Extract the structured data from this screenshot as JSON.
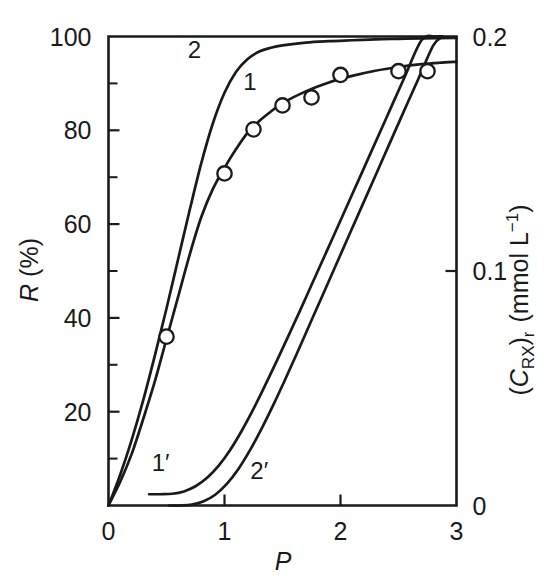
{
  "chart_data": {
    "type": "line",
    "title": "",
    "subtitle": "",
    "xlabel": "P",
    "xlabel_style": "italic",
    "ylabel": "R (%)",
    "ylabel_left_parts": {
      "symbol": "R",
      "units": "(%)"
    },
    "ylabel_right": "(C_RX)_r (mmol L^-1)",
    "ylabel_right_parts": {
      "open_paren": "(",
      "symbol": "C",
      "symbol_sub": "RX",
      "close_paren": ")",
      "close_sub": "r",
      "units_open": "(mmol L",
      "units_sup": "−1",
      "units_close": ")"
    },
    "xlim": [
      0,
      3
    ],
    "ylim_left": [
      0,
      100
    ],
    "ylim_right": [
      0,
      0.2
    ],
    "grid": false,
    "legend": "inline-curve-labels",
    "x_ticks_major": [
      0,
      1,
      2,
      3
    ],
    "x_ticklabels": [
      "0",
      "1",
      "2",
      "3"
    ],
    "y_left_ticks_major": [
      0,
      20,
      40,
      60,
      80,
      100
    ],
    "y_left_ticklabels": [
      "0",
      "20",
      "40",
      "60",
      "80",
      "100"
    ],
    "y_left_ticklabels_shown": [
      "20",
      "40",
      "60",
      "80",
      "100"
    ],
    "y_left_ticks_minor": [
      10,
      30,
      50,
      70,
      90
    ],
    "y_right_ticks_major": [
      0,
      0.1,
      0.2
    ],
    "y_right_ticklabels": [
      "0",
      "0.1",
      "0.2"
    ],
    "series": [
      {
        "name": "1",
        "label": "1",
        "axis": "left",
        "label_x": 1.22,
        "label_y": 88.5,
        "points": [
          [
            0.0,
            0.0
          ],
          [
            0.1,
            5.0
          ],
          [
            0.2,
            11.0
          ],
          [
            0.3,
            18.5
          ],
          [
            0.4,
            26.5
          ],
          [
            0.5,
            35.5
          ],
          [
            0.6,
            44.5
          ],
          [
            0.7,
            53.5
          ],
          [
            0.8,
            61.5
          ],
          [
            0.9,
            67.5
          ],
          [
            1.0,
            72.0
          ],
          [
            1.1,
            76.0
          ],
          [
            1.2,
            79.5
          ],
          [
            1.3,
            82.0
          ],
          [
            1.4,
            84.0
          ],
          [
            1.5,
            85.8
          ],
          [
            1.7,
            88.3
          ],
          [
            1.9,
            90.2
          ],
          [
            2.1,
            91.6
          ],
          [
            2.3,
            92.7
          ],
          [
            2.5,
            93.5
          ],
          [
            2.7,
            94.1
          ],
          [
            2.85,
            94.4
          ],
          [
            3.0,
            94.6
          ]
        ]
      },
      {
        "name": "2",
        "label": "2",
        "axis": "left",
        "label_x": 0.74,
        "label_y": 95.5,
        "points": [
          [
            0.0,
            0.0
          ],
          [
            0.1,
            6.5
          ],
          [
            0.2,
            14.0
          ],
          [
            0.3,
            22.5
          ],
          [
            0.4,
            32.0
          ],
          [
            0.5,
            42.0
          ],
          [
            0.6,
            52.5
          ],
          [
            0.7,
            63.0
          ],
          [
            0.8,
            73.0
          ],
          [
            0.9,
            81.5
          ],
          [
            1.0,
            88.0
          ],
          [
            1.1,
            92.5
          ],
          [
            1.2,
            95.2
          ],
          [
            1.3,
            96.8
          ],
          [
            1.4,
            97.6
          ],
          [
            1.5,
            98.1
          ],
          [
            1.7,
            98.7
          ],
          [
            1.9,
            99.0
          ],
          [
            2.1,
            99.2
          ],
          [
            2.3,
            99.4
          ],
          [
            2.5,
            99.5
          ],
          [
            2.7,
            99.6
          ],
          [
            3.0,
            99.7
          ]
        ]
      },
      {
        "name": "1'",
        "label": "1′",
        "axis": "right",
        "label_x": 0.45,
        "label_y_right": 0.0148,
        "points": [
          [
            0.35,
            0.0048
          ],
          [
            0.45,
            0.0048
          ],
          [
            0.55,
            0.005
          ],
          [
            0.65,
            0.006
          ],
          [
            0.75,
            0.0082
          ],
          [
            0.85,
            0.0118
          ],
          [
            0.95,
            0.017
          ],
          [
            1.05,
            0.0238
          ],
          [
            1.15,
            0.032
          ],
          [
            1.25,
            0.0412
          ],
          [
            1.35,
            0.0512
          ],
          [
            1.45,
            0.0616
          ],
          [
            1.55,
            0.0722
          ],
          [
            1.65,
            0.083
          ],
          [
            1.75,
            0.094
          ],
          [
            1.85,
            0.105
          ],
          [
            1.95,
            0.116
          ],
          [
            2.1,
            0.1326
          ],
          [
            2.25,
            0.1492
          ],
          [
            2.4,
            0.1658
          ],
          [
            2.55,
            0.1824
          ],
          [
            2.7,
            0.1985
          ],
          [
            2.82,
            0.206
          ],
          [
            2.88,
            0.208
          ]
        ]
      },
      {
        "name": "2'",
        "label": "2′",
        "axis": "right",
        "label_x": 1.3,
        "label_y_right": 0.0115,
        "points": [
          [
            0.52,
            0.0
          ],
          [
            0.62,
            0.0
          ],
          [
            0.72,
            0.0004
          ],
          [
            0.82,
            0.0018
          ],
          [
            0.92,
            0.0046
          ],
          [
            1.02,
            0.0092
          ],
          [
            1.12,
            0.0156
          ],
          [
            1.22,
            0.0236
          ],
          [
            1.32,
            0.0328
          ],
          [
            1.42,
            0.0428
          ],
          [
            1.52,
            0.0534
          ],
          [
            1.62,
            0.0644
          ],
          [
            1.72,
            0.0756
          ],
          [
            1.82,
            0.0868
          ],
          [
            1.92,
            0.098
          ],
          [
            2.07,
            0.1148
          ],
          [
            2.22,
            0.1316
          ],
          [
            2.37,
            0.1484
          ],
          [
            2.52,
            0.1652
          ],
          [
            2.67,
            0.1818
          ],
          [
            2.8,
            0.1962
          ],
          [
            2.88,
            0.2042
          ]
        ]
      }
    ],
    "scatter": {
      "name": "experimental-points",
      "axis": "left",
      "marker": "open-circle",
      "points": [
        [
          0.5,
          36.0
        ],
        [
          1.0,
          70.8
        ],
        [
          1.25,
          80.2
        ],
        [
          1.5,
          85.3
        ],
        [
          1.75,
          87.0
        ],
        [
          2.0,
          91.8
        ],
        [
          2.5,
          92.6
        ],
        [
          2.75,
          92.6
        ]
      ]
    },
    "colors": {
      "line": "#1a1a1a",
      "marker_fill": "#ffffff",
      "background": "#ffffff"
    }
  }
}
